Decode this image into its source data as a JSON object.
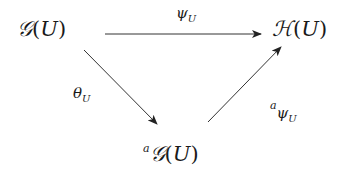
{
  "diagram": {
    "type": "commutative-diagram",
    "nodes": [
      {
        "id": "G",
        "prefix": "",
        "symbol": "𝒢",
        "arg": "U"
      },
      {
        "id": "H",
        "prefix": "",
        "symbol": "ℋ",
        "arg": "U"
      },
      {
        "id": "aG",
        "prefix": "a",
        "symbol": "𝒢",
        "arg": "U"
      }
    ],
    "arrows": [
      {
        "from": "G",
        "to": "H",
        "label_main": "ψ",
        "label_sub": "U",
        "label_pre": ""
      },
      {
        "from": "G",
        "to": "aG",
        "label_main": "θ",
        "label_sub": "U",
        "label_pre": ""
      },
      {
        "from": "aG",
        "to": "H",
        "label_main": "ψ",
        "label_sub": "U",
        "label_pre": "a"
      }
    ],
    "colors": {
      "line": "#333333",
      "text": "#1a1a1a",
      "background": "#ffffff"
    }
  }
}
